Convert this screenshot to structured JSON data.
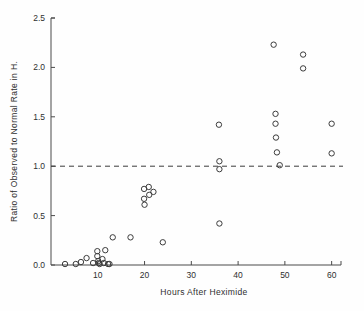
{
  "chart_data": {
    "type": "scatter",
    "title": "",
    "xlabel": "Hours After Heximide",
    "ylabel": "Ratio of Observed to Normal Rate in H.",
    "xlim": [
      0,
      62
    ],
    "ylim": [
      0.0,
      2.5
    ],
    "xticks": [
      10,
      20,
      30,
      40,
      50,
      60
    ],
    "xtick_labels": [
      "10",
      "20",
      "30",
      "40",
      "50",
      "60"
    ],
    "yticks": [
      0.0,
      0.5,
      1.0,
      1.5,
      2.0,
      2.5
    ],
    "ytick_labels": [
      "0.0",
      "0.5",
      "1.0",
      "1.5",
      "2.0",
      "2.5"
    ],
    "grid": false,
    "legend": null,
    "marker": "open-circle",
    "reference_line": {
      "orientation": "horizontal",
      "y": 1.0,
      "style": "dashed",
      "label": ""
    },
    "points": [
      {
        "x": 3.0,
        "y": 0.01
      },
      {
        "x": 5.3,
        "y": 0.01
      },
      {
        "x": 6.4,
        "y": 0.03
      },
      {
        "x": 7.6,
        "y": 0.07
      },
      {
        "x": 9.0,
        "y": 0.02
      },
      {
        "x": 9.9,
        "y": 0.14
      },
      {
        "x": 9.9,
        "y": 0.09
      },
      {
        "x": 10.1,
        "y": 0.04
      },
      {
        "x": 10.2,
        "y": 0.02
      },
      {
        "x": 10.4,
        "y": 0.01
      },
      {
        "x": 11.0,
        "y": 0.06
      },
      {
        "x": 11.3,
        "y": 0.02
      },
      {
        "x": 11.6,
        "y": 0.15
      },
      {
        "x": 12.2,
        "y": 0.01
      },
      {
        "x": 12.5,
        "y": 0.01
      },
      {
        "x": 13.2,
        "y": 0.28
      },
      {
        "x": 17.0,
        "y": 0.28
      },
      {
        "x": 19.9,
        "y": 0.77
      },
      {
        "x": 19.9,
        "y": 0.67
      },
      {
        "x": 20.0,
        "y": 0.61
      },
      {
        "x": 20.9,
        "y": 0.79
      },
      {
        "x": 21.0,
        "y": 0.71
      },
      {
        "x": 21.9,
        "y": 0.74
      },
      {
        "x": 23.9,
        "y": 0.23
      },
      {
        "x": 35.9,
        "y": 1.42
      },
      {
        "x": 36.0,
        "y": 1.05
      },
      {
        "x": 36.0,
        "y": 0.97
      },
      {
        "x": 36.0,
        "y": 0.42
      },
      {
        "x": 47.6,
        "y": 2.23
      },
      {
        "x": 48.0,
        "y": 1.53
      },
      {
        "x": 48.0,
        "y": 1.43
      },
      {
        "x": 48.1,
        "y": 1.29
      },
      {
        "x": 48.3,
        "y": 1.14
      },
      {
        "x": 48.9,
        "y": 1.01
      },
      {
        "x": 53.9,
        "y": 2.13
      },
      {
        "x": 53.9,
        "y": 1.99
      },
      {
        "x": 60.0,
        "y": 1.43
      },
      {
        "x": 60.0,
        "y": 1.13
      }
    ]
  }
}
